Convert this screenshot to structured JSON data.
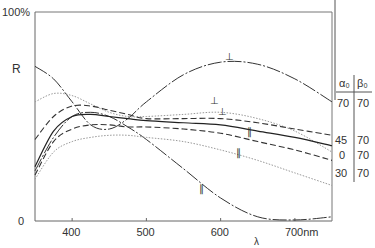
{
  "chart_data": {
    "type": "line",
    "title": "",
    "xlabel": "λ",
    "ylabel": "R",
    "x_unit": "nm",
    "xlim": [
      350,
      750
    ],
    "ylim": [
      0,
      100
    ],
    "y_tick_labels": [
      "0",
      "100%"
    ],
    "x_ticks": [
      400,
      500,
      600,
      700
    ],
    "x_tick_labels": [
      "400",
      "500",
      "600",
      "700nm"
    ],
    "grid": false,
    "legend_table": {
      "headers": [
        "α₀",
        "β₀"
      ],
      "rows": [
        {
          "alpha": "70",
          "beta": "70"
        },
        {
          "alpha": "45",
          "beta": "70"
        },
        {
          "alpha": "0",
          "beta": "70"
        },
        {
          "alpha": "30",
          "beta": "70"
        }
      ]
    },
    "x": [
      350,
      375,
      400,
      425,
      450,
      475,
      500,
      550,
      600,
      650,
      700,
      750
    ],
    "series": [
      {
        "name": "70/70 ⊥",
        "style": "dash-dot",
        "polarization": "⊥",
        "values": [
          74,
          68,
          57,
          46,
          44,
          49,
          57,
          70,
          76,
          75,
          68,
          57
        ]
      },
      {
        "name": "70/70 ∥",
        "style": "dash-dot",
        "polarization": "∥",
        "values": [
          24,
          40,
          50,
          52,
          50,
          45,
          39,
          25,
          11,
          2,
          0.5,
          2
        ]
      },
      {
        "name": "45/70 ⊥ (dotted)",
        "style": "dotted",
        "polarization": "⊥",
        "values": [
          57,
          61,
          60,
          56,
          52,
          50,
          50,
          51,
          52,
          49,
          43,
          33
        ]
      },
      {
        "name": "45/70 ⊥ (dashed)",
        "style": "dashed",
        "polarization": "⊥",
        "values": [
          39,
          50,
          55,
          55,
          53,
          51,
          49,
          49,
          49,
          47,
          44,
          41
        ]
      },
      {
        "name": "0/70",
        "style": "solid",
        "polarization": "",
        "values": [
          26,
          43,
          50,
          51,
          50,
          49,
          48,
          47,
          46,
          43,
          40,
          36
        ]
      },
      {
        "name": "30/70 ∥ (dashed)",
        "style": "dashed",
        "polarization": "∥",
        "values": [
          22,
          38,
          44,
          46,
          46,
          45,
          45,
          44,
          42,
          38,
          34,
          29
        ]
      },
      {
        "name": "∥ (dotted)",
        "style": "dotted",
        "polarization": "∥",
        "values": [
          20,
          33,
          38,
          40,
          41,
          41,
          40,
          38,
          34,
          29,
          23,
          17
        ]
      }
    ],
    "annotations": [
      {
        "text": "⊥",
        "x": 610,
        "y": 76
      },
      {
        "text": "⊥",
        "x": 590,
        "y": 55
      },
      {
        "text": "⊥",
        "x": 600,
        "y": 50
      },
      {
        "text": "∥",
        "x": 640,
        "y": 40
      },
      {
        "text": "∥",
        "x": 625,
        "y": 30
      },
      {
        "text": "∥",
        "x": 575,
        "y": 13
      }
    ]
  }
}
